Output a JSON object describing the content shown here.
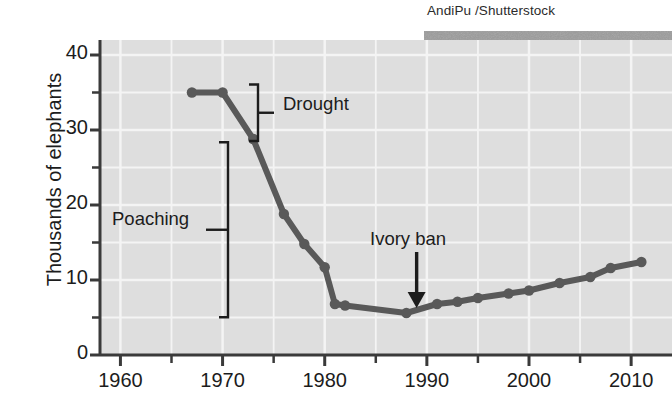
{
  "credit": "AndiPu /Shutterstock",
  "axes": {
    "ylabel": "Thousands of elephants",
    "yticks": [
      "0",
      "10",
      "20",
      "30",
      "40"
    ],
    "ytick_values": [
      0,
      10,
      20,
      30,
      40
    ],
    "yminor_values": [
      5,
      15,
      25,
      35
    ],
    "xticks": [
      "1960",
      "1970",
      "1980",
      "1990",
      "2000",
      "2010"
    ],
    "xtick_values": [
      1960,
      1970,
      1980,
      1990,
      2000,
      2010
    ],
    "xminor_values": [
      1965,
      1975,
      1985,
      1995,
      2005
    ],
    "xlim": [
      1958,
      2014
    ],
    "ylim": [
      0,
      42
    ]
  },
  "annotations": {
    "drought": "Drought",
    "poaching": "Poaching",
    "ivory_ban": "Ivory ban"
  },
  "colors": {
    "line": "#595959",
    "plot_background": "#dedede",
    "grid": "#f2f2f2",
    "axis": "#3a3a3a",
    "text": "#1c1c1c"
  },
  "chart_data": {
    "type": "line",
    "title": "",
    "xlabel": "",
    "ylabel": "Thousands of elephants",
    "xlim": [
      1958,
      2014
    ],
    "ylim": [
      0,
      42
    ],
    "grid": true,
    "legend": "none",
    "series": [
      {
        "name": "Elephant population",
        "x": [
          1967,
          1970,
          1973,
          1976,
          1978,
          1980,
          1981,
          1982,
          1988,
          1991,
          1993,
          1995,
          1998,
          2000,
          2003,
          2006,
          2008,
          2011
        ],
        "values": [
          35.0,
          35.0,
          28.8,
          18.8,
          14.8,
          11.7,
          6.8,
          6.6,
          5.6,
          6.8,
          7.1,
          7.6,
          8.2,
          8.6,
          9.6,
          10.4,
          11.6,
          12.4
        ]
      }
    ],
    "annotations": [
      {
        "text": "Drought",
        "type": "bracket",
        "y_range": [
          28.8,
          35.8
        ],
        "at_x": 1981.5
      },
      {
        "text": "Poaching",
        "type": "bracket",
        "y_range": [
          5.3,
          28.1
        ],
        "at_x": 1976.5
      },
      {
        "text": "Ivory ban",
        "type": "arrow",
        "at_x": 1989,
        "points_to_y": 6.0
      }
    ]
  }
}
